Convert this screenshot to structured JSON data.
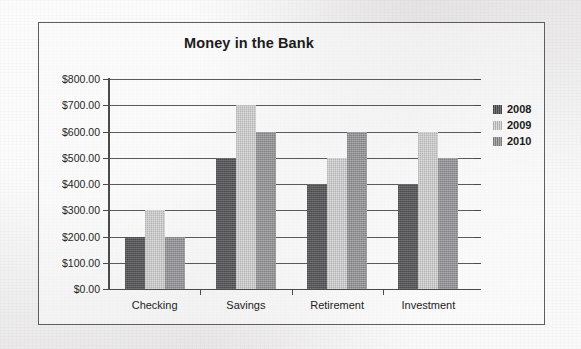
{
  "chart_data": {
    "type": "bar",
    "title": "Money in the Bank",
    "xlabel": "",
    "ylabel": "",
    "categories": [
      "Checking",
      "Savings",
      "Retirement",
      "Investment"
    ],
    "series": [
      {
        "name": "2008",
        "color": "#58585a",
        "values": [
          200,
          500,
          400,
          400
        ]
      },
      {
        "name": "2009",
        "color": "#cbcbcb",
        "values": [
          300,
          700,
          500,
          600
        ]
      },
      {
        "name": "2010",
        "color": "#949496",
        "values": [
          200,
          600,
          600,
          500
        ]
      }
    ],
    "ylim": [
      0,
      800
    ],
    "ytick_step": 100,
    "ytick_labels": [
      "$0.00",
      "$100.00",
      "$200.00",
      "$300.00",
      "$400.00",
      "$500.00",
      "$600.00",
      "$700.00",
      "$800.00"
    ],
    "grid": true,
    "legend_position": "right",
    "currency_prefix": "$",
    "value_format": "0.00"
  }
}
